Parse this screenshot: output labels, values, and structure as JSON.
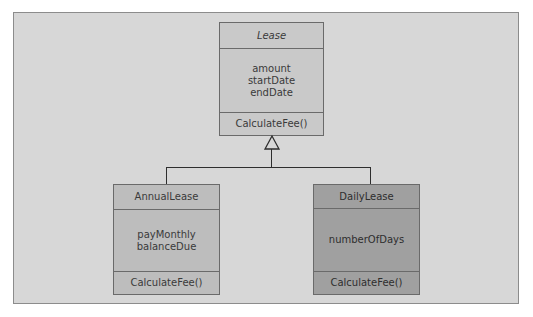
{
  "diagram": {
    "type": "uml-class-inheritance",
    "background_color": "#d7d7d7",
    "classes": {
      "parent": {
        "name": "Lease",
        "abstract": true,
        "attributes": [
          "amount",
          "startDate",
          "endDate"
        ],
        "methods": [
          "CalculateFee()"
        ],
        "fill": "#c9c9c9"
      },
      "annual": {
        "name": "AnnualLease",
        "attributes": [
          "payMonthly",
          "balanceDue"
        ],
        "methods": [
          "CalculateFee()"
        ],
        "fill": "#bdbdbd"
      },
      "daily": {
        "name": "DailyLease",
        "attributes": [
          "numberOfDays"
        ],
        "methods": [
          "CalculateFee()"
        ],
        "fill": "#a0a0a0"
      }
    },
    "relationships": [
      {
        "type": "generalization",
        "from": "AnnualLease",
        "to": "Lease"
      },
      {
        "type": "generalization",
        "from": "DailyLease",
        "to": "Lease"
      }
    ]
  }
}
